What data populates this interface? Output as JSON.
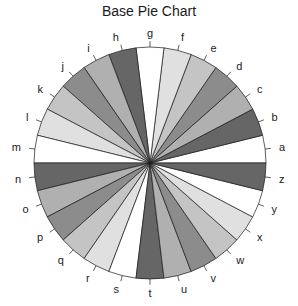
{
  "chart_data": {
    "type": "pie",
    "title": "Base Pie Chart",
    "labels": [
      "a",
      "b",
      "c",
      "d",
      "e",
      "f",
      "g",
      "h",
      "i",
      "j",
      "k",
      "l",
      "m",
      "n",
      "o",
      "p",
      "q",
      "r",
      "s",
      "t",
      "u",
      "v",
      "w",
      "x",
      "y",
      "z"
    ],
    "values": [
      1,
      1,
      1,
      1,
      1,
      1,
      1,
      1,
      1,
      1,
      1,
      1,
      1,
      1,
      1,
      1,
      1,
      1,
      1,
      1,
      1,
      1,
      1,
      1,
      1,
      1
    ],
    "colors": [
      "#ffffff",
      "#666666",
      "#b0b0b0",
      "#8c8c8c",
      "#c4c4c4",
      "#e0e0e0"
    ],
    "start_angle_deg": 0,
    "direction": "counterclockwise",
    "legend": "none",
    "grid": false
  },
  "geometry": {
    "cx": 150,
    "cy": 163,
    "r": 116
  }
}
